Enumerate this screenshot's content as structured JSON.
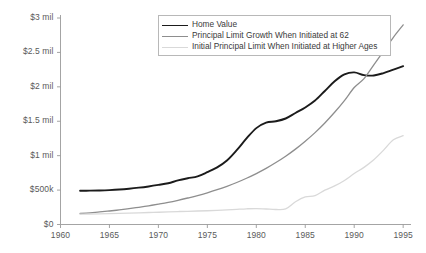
{
  "chart_data": {
    "type": "line",
    "title": "",
    "xlabel": "",
    "ylabel": "",
    "xlim": [
      1960,
      1995.8
    ],
    "ylim": [
      0,
      3000000
    ],
    "grid": false,
    "legend_position": "top-center",
    "xticks": [
      1960,
      1965,
      1970,
      1975,
      1980,
      1985,
      1990,
      1995
    ],
    "xtick_labels": [
      "1960",
      "1965",
      "1970",
      "1975",
      "1980",
      "1985",
      "1990",
      "1995"
    ],
    "yticks": [
      0,
      500000,
      1000000,
      1500000,
      2000000,
      2500000,
      3000000
    ],
    "ytick_labels": [
      "$0",
      "$500k",
      "$1 mil",
      "$1.5 mil",
      "$2 mil",
      "$2.5 mil",
      "$3 mil"
    ],
    "series": [
      {
        "name": "Home Value",
        "color": "#1b1b1b",
        "width": 1.9,
        "x": [
          1962,
          1963,
          1964,
          1965,
          1966,
          1967,
          1968,
          1969,
          1970,
          1971,
          1972,
          1973,
          1974,
          1975,
          1976,
          1977,
          1978,
          1979,
          1980,
          1981,
          1982,
          1983,
          1984,
          1985,
          1986,
          1987,
          1988,
          1989,
          1990,
          1991,
          1992,
          1993,
          1994,
          1995
        ],
        "values": [
          490000,
          492000,
          495000,
          500000,
          508000,
          520000,
          535000,
          553000,
          575000,
          600000,
          640000,
          672000,
          700000,
          760000,
          830000,
          930000,
          1080000,
          1250000,
          1400000,
          1480000,
          1500000,
          1540000,
          1620000,
          1700000,
          1800000,
          1940000,
          2080000,
          2180000,
          2210000,
          2170000,
          2165000,
          2200000,
          2250000,
          2300000
        ]
      },
      {
        "name": "Principal Limit Growth When Initiated at 62",
        "color": "#8e8e8e",
        "width": 1.3,
        "x": [
          1962,
          1963,
          1964,
          1965,
          1966,
          1967,
          1968,
          1969,
          1970,
          1971,
          1972,
          1973,
          1974,
          1975,
          1976,
          1977,
          1978,
          1979,
          1980,
          1981,
          1982,
          1983,
          1984,
          1985,
          1986,
          1987,
          1988,
          1989,
          1990,
          1991,
          1992,
          1993,
          1994,
          1995
        ],
        "values": [
          160000,
          170000,
          182000,
          196000,
          212000,
          230000,
          250000,
          272000,
          296000,
          322000,
          352000,
          385000,
          420000,
          460000,
          505000,
          555000,
          610000,
          672000,
          740000,
          815000,
          900000,
          992000,
          1095000,
          1210000,
          1335000,
          1475000,
          1630000,
          1800000,
          1990000,
          2120000,
          2320000,
          2520000,
          2720000,
          2900000
        ]
      },
      {
        "name": "Initial Principal Limit When Initiated at Higher Ages",
        "color": "#d9d9d9",
        "width": 1.3,
        "x": [
          1962,
          1963,
          1964,
          1965,
          1966,
          1967,
          1968,
          1969,
          1970,
          1971,
          1972,
          1973,
          1974,
          1975,
          1976,
          1977,
          1978,
          1979,
          1980,
          1981,
          1982,
          1983,
          1984,
          1985,
          1986,
          1987,
          1988,
          1989,
          1990,
          1991,
          1992,
          1993,
          1994,
          1995
        ],
        "values": [
          150000,
          152000,
          155000,
          158000,
          162000,
          166000,
          170000,
          174000,
          178000,
          182000,
          188000,
          192000,
          196000,
          200000,
          206000,
          212000,
          220000,
          228000,
          232000,
          225000,
          218000,
          228000,
          330000,
          400000,
          420000,
          500000,
          560000,
          640000,
          740000,
          830000,
          940000,
          1080000,
          1230000,
          1290000
        ]
      }
    ]
  },
  "legend": {
    "items": [
      {
        "label": "Home Value",
        "swatch": "sw-home"
      },
      {
        "label": "Principal Limit Growth When Initiated at 62",
        "swatch": "sw-pl"
      },
      {
        "label": "Initial Principal Limit When Initiated at Higher Ages",
        "swatch": "sw-ipl"
      }
    ]
  },
  "axis_colors": {
    "axis_line": "#9a9a9a",
    "tick_text": "#5a5a5a"
  }
}
